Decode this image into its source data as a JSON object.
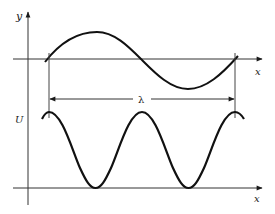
{
  "diagram": {
    "colors": {
      "ink": "#1a1a1a",
      "background": "#ffffff"
    },
    "top_panel": {
      "y_axis_label": "y",
      "x_axis_label": "x",
      "curve": "sine, one full wavelength"
    },
    "wavelength_label": "λ",
    "bottom_panel": {
      "y_axis_label": "U",
      "x_axis_label": "x",
      "curve": "sin² shaped, two humps per wavelength, maxima at wave nodes"
    }
  }
}
